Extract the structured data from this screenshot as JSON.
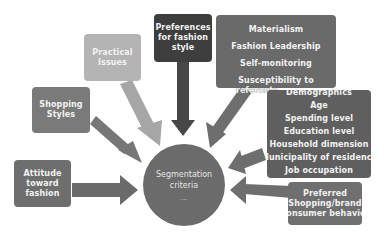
{
  "diagram": {
    "center": {
      "label_lines": [
        "Segmentation",
        "criteria"
      ],
      "footer": "..."
    },
    "nodes": [
      {
        "id": "attitude",
        "lines": [
          "Attitude",
          "toward",
          "fashion"
        ],
        "color": "#6e6e6e"
      },
      {
        "id": "shopping-styles",
        "lines": [
          "Shopping",
          "Styles"
        ],
        "color": "#7a7a7a"
      },
      {
        "id": "practical-issues",
        "lines": [
          "Practical",
          "Issues"
        ],
        "color": "#b4b4b4"
      },
      {
        "id": "preferences",
        "lines": [
          "Preferences",
          "for fashion",
          "style"
        ],
        "color": "#3e3e3e"
      },
      {
        "id": "psychographics",
        "lines": [
          "Materialism",
          "Fashion Leadership",
          "Self-monitoring",
          "Susceptibility to",
          "referents"
        ],
        "color": "#6a6a6a"
      },
      {
        "id": "demographics",
        "lines": [
          "Demographics",
          "Age",
          "Spending level",
          "Education level",
          "Household dimension",
          "Municipality of residence",
          "Job occupation"
        ],
        "color": "#5f5f5f"
      },
      {
        "id": "preferred",
        "lines": [
          "Preferred",
          "Shopping/brand",
          "Consumer behavior"
        ],
        "color": "#6f6f6f"
      }
    ],
    "colors": {
      "background": "#ffffff",
      "center_fill": "#6b6b6b",
      "text_light": "#f2f2f2",
      "arrow_dark": "#474747",
      "arrow_mid": "#777777",
      "arrow_light": "#a6a6a6"
    }
  }
}
